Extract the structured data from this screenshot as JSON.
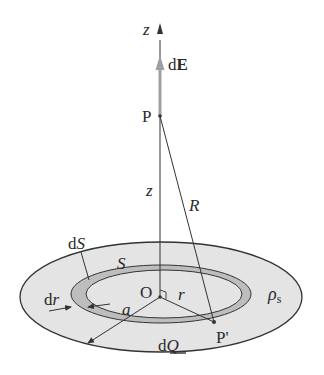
{
  "diagram": {
    "colors": {
      "disk_fill": "#e4e4e4",
      "ring_fill": "#bdbdbd",
      "stroke": "#333333",
      "field_arrow": "#9a9a9a"
    },
    "labels": {
      "z_axis": "z",
      "dE_d": "d",
      "dE_E": "E",
      "point_P": "P",
      "z_distance": "z",
      "R_distance": "R",
      "dS_d": "d",
      "dS_S": "S",
      "S": "S",
      "dr_d": "d",
      "dr_r": "r",
      "origin": "O",
      "r": "r",
      "a": "a",
      "rho": "ρ",
      "rho_sub": "s",
      "point_P_prime": "P'",
      "dQ_d": "d",
      "dQ_Q": "Q"
    }
  }
}
